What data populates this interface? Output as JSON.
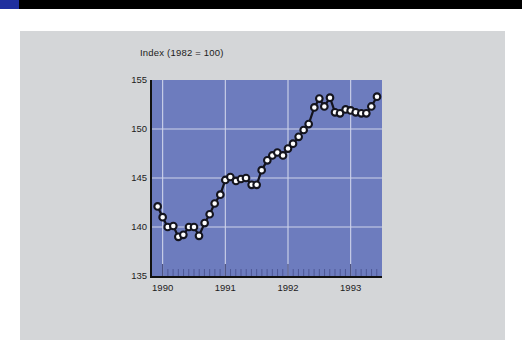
{
  "figure": {
    "top_bar_color": "#000000",
    "top_bar_accent_color": "#1f2f9e",
    "card_background": "#d4d6d8"
  },
  "chart_data": {
    "type": "line",
    "title": "Index  (1982 = 100)",
    "xlabel": "",
    "ylabel": "",
    "plot_background": "#6d7cbe",
    "grid": true,
    "grid_color": "#cfd4ea",
    "line_color": "#14141e",
    "marker_face_color": "#ffffff",
    "marker_edge_color": "#14141e",
    "legend": "none",
    "xlim": [
      1989.83,
      1993.5
    ],
    "ylim": [
      135,
      155
    ],
    "yticks": [
      135,
      140,
      145,
      150,
      155
    ],
    "ytick_labels": [
      "135",
      "140",
      "145",
      "150",
      "155"
    ],
    "xticks": [
      1990,
      1991,
      1992,
      1993
    ],
    "xtick_labels": [
      "1990",
      "1991",
      "1992",
      "1993"
    ],
    "x_minor_tick_interval": 0.0833,
    "x_minor_tick_note": "monthly tick marks along bottom axis",
    "series": [
      {
        "name": "Index (1982 = 100)",
        "x": [
          1989.92,
          1990.0,
          1990.08,
          1990.17,
          1990.25,
          1990.33,
          1990.42,
          1990.5,
          1990.58,
          1990.67,
          1990.75,
          1990.83,
          1990.92,
          1991.0,
          1991.08,
          1991.17,
          1991.25,
          1991.33,
          1991.42,
          1991.5,
          1991.58,
          1991.67,
          1991.75,
          1991.83,
          1991.92,
          1992.0,
          1992.08,
          1992.17,
          1992.25,
          1992.33,
          1992.42,
          1992.5,
          1992.58,
          1992.67,
          1992.75,
          1992.83,
          1992.92,
          1993.0,
          1993.08,
          1993.17,
          1993.25,
          1993.33,
          1993.42
        ],
        "values": [
          142.1,
          141.0,
          140.0,
          140.1,
          139.0,
          139.2,
          140.0,
          140.0,
          139.1,
          140.4,
          141.3,
          142.4,
          143.3,
          144.8,
          145.1,
          144.7,
          144.9,
          145.0,
          144.3,
          144.3,
          145.8,
          146.8,
          147.3,
          147.6,
          147.3,
          148.0,
          148.5,
          149.2,
          149.9,
          150.5,
          152.2,
          153.1,
          152.3,
          153.2,
          151.7,
          151.6,
          152.0,
          151.9,
          151.7,
          151.6,
          151.6,
          152.3,
          153.3
        ]
      }
    ]
  }
}
